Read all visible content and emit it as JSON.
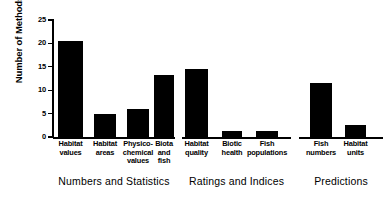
{
  "chart_data": {
    "type": "bar",
    "title": "",
    "xlabel": "",
    "ylabel": "Number of Methods",
    "ylim": [
      0,
      25
    ],
    "yticks": [
      0,
      5,
      10,
      15,
      20,
      25
    ],
    "grid": false,
    "legend": false,
    "bar_color": "#000000",
    "axis_color": "#000000",
    "categories": [
      "Habitat values",
      "Habitat areas",
      "Physico-chemical values",
      "Biota and fish",
      "Habitat quality",
      "Biotic health",
      "Fish populations",
      "Fish numbers",
      "Habitat units"
    ],
    "values": [
      20.5,
      5.0,
      6.0,
      13.3,
      14.5,
      1.2,
      1.2,
      11.6,
      2.6
    ],
    "groups": [
      {
        "label": "Numbers and Statistics",
        "categories": [
          {
            "lines": [
              "Habitat",
              "values"
            ],
            "value": 20.5
          },
          {
            "lines": [
              "Habitat",
              "areas"
            ],
            "value": 5.0
          },
          {
            "lines": [
              "Physico-",
              "chemical",
              "values"
            ],
            "value": 6.0
          },
          {
            "lines": [
              "Biota",
              "and",
              "fish"
            ],
            "value": 13.3
          }
        ]
      },
      {
        "label": "Ratings and Indices",
        "categories": [
          {
            "lines": [
              "Habitat",
              "quality"
            ],
            "value": 14.5
          },
          {
            "lines": [
              "Biotic",
              "health"
            ],
            "value": 1.2
          },
          {
            "lines": [
              "Fish",
              "populations"
            ],
            "value": 1.2
          }
        ]
      },
      {
        "label": "Predictions",
        "categories": [
          {
            "lines": [
              "Fish",
              "numbers"
            ],
            "value": 11.6
          },
          {
            "lines": [
              "Habitat",
              "units"
            ],
            "value": 2.6
          }
        ]
      }
    ],
    "ytick_labels": [
      "0",
      "5",
      "10",
      "15",
      "20",
      "25"
    ],
    "group_labels": [
      "Numbers and Statistics",
      "Ratings and Indices",
      "Predictions"
    ]
  }
}
